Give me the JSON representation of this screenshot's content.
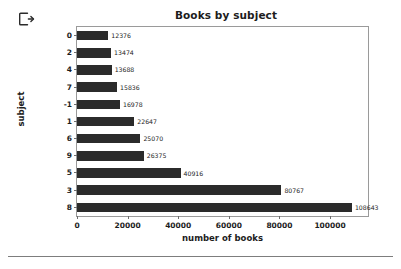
{
  "toolbar": {
    "exit_icon": "exit-icon"
  },
  "chart_data": {
    "type": "bar",
    "orientation": "horizontal",
    "title": "Books by subject",
    "xlabel": "number of books",
    "ylabel": "subject",
    "categories": [
      "0",
      "2",
      "4",
      "7",
      "-1",
      "1",
      "6",
      "9",
      "5",
      "3",
      "8"
    ],
    "values": [
      12376,
      13474,
      13688,
      15836,
      16978,
      22647,
      25070,
      26375,
      40916,
      80767,
      108643
    ],
    "value_labels": [
      "12376",
      "13474",
      "13688",
      "15836",
      "16978",
      "22647",
      "25070",
      "26375",
      "40916",
      "80767",
      "108643"
    ],
    "xlim": [
      0,
      115000
    ],
    "xticks": [
      0,
      20000,
      40000,
      60000,
      80000,
      100000
    ],
    "xtick_labels": [
      "0",
      "20000",
      "40000",
      "60000",
      "80000",
      "100000"
    ],
    "grid": false,
    "legend": false,
    "bar_color": "#2b2b2b",
    "background_color": "#ffffff",
    "border_color": "#9a9a9a"
  }
}
